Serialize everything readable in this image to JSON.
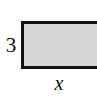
{
  "figure": {
    "name": "labeled-rectangle",
    "type": "geometry-diagram",
    "background_color": "#ffffff"
  },
  "shape": {
    "kind": "rectangle",
    "fill_color": "#d6d6d6",
    "stroke_color": "#111111",
    "stroke_width_px": 3,
    "clipped_edge": "right"
  },
  "labels": {
    "height": "3",
    "width": "x"
  },
  "chart_data": {
    "type": "diagram",
    "title": "",
    "shape": "rectangle",
    "dimensions": [
      {
        "side": "height",
        "label": "3",
        "position": "left"
      },
      {
        "side": "width",
        "label": "x",
        "position": "bottom"
      }
    ]
  }
}
